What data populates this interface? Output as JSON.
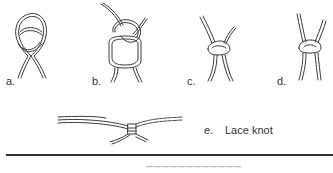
{
  "figures": [
    {
      "id": "a",
      "label": "a."
    },
    {
      "id": "b",
      "label": "b."
    },
    {
      "id": "c",
      "label": "c."
    },
    {
      "id": "d",
      "label": "d."
    },
    {
      "id": "e",
      "label": "e.",
      "caption": "Lace knot"
    }
  ],
  "footer": {
    "clipped_text": "illegible (cut off at image edge)"
  },
  "colors": {
    "ink": "#333333",
    "background": "#ffffff"
  }
}
